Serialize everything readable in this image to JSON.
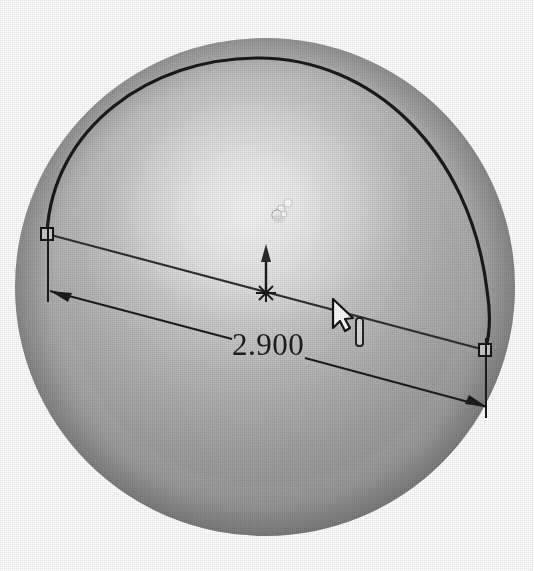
{
  "viewport": {
    "background_color": "#ffffff",
    "width": 534,
    "height": 571,
    "label": "3D model graphics area"
  },
  "model": {
    "name": "sphere-body",
    "shape": "sphere",
    "shading": "shaded",
    "base_color": "#9a9a9a",
    "highlight_color": "#e2e2e2",
    "shadow_color": "#6e6e6e",
    "center_x": 265,
    "center_y": 287,
    "radius_x": 250,
    "radius_y": 249
  },
  "sketch": {
    "arc": {
      "name": "semicircular-arc",
      "color": "#1a1a1a",
      "stroke_width": 3.2
    },
    "chord": {
      "name": "chord-line",
      "color": "#2b2b2b",
      "stroke_width": 2.2,
      "start_x": 47,
      "start_y": 234,
      "end_x": 485,
      "end_y": 350
    },
    "endpoints": [
      {
        "name": "endpoint-handle-left",
        "x": 47,
        "y": 234
      },
      {
        "name": "endpoint-handle-right",
        "x": 485,
        "y": 350
      }
    ],
    "origin": {
      "name": "sketch-origin-marker",
      "x": 266,
      "y": 293,
      "glyph": "asterisk-point"
    },
    "axis_arrow": {
      "name": "revolve-axis-arrow",
      "direction": "up",
      "x": 266,
      "tail_y": 293,
      "head_y": 250
    }
  },
  "dimension": {
    "name": "linear-dimension",
    "value": "2.900",
    "units": "in",
    "color": "#1c1c1c",
    "text_x": 268,
    "text_y": 355,
    "arrow_left": {
      "x": 50,
      "y": 291
    },
    "arrow_right": {
      "x": 487,
      "y": 407
    },
    "extension_left": {
      "x": 48,
      "y_top": 234,
      "y_bottom": 300
    },
    "extension_right": {
      "x": 486,
      "y_top": 350,
      "y_bottom": 416
    }
  },
  "cursor": {
    "name": "mouse-pointer",
    "type": "arrow",
    "x": 337,
    "y": 308,
    "color": "#1f1f1f"
  },
  "text_indicator": {
    "name": "text-edit-ibeam",
    "type": "i-beam",
    "x": 360,
    "y": 330,
    "color": "#262626"
  },
  "selection_glyph": {
    "name": "selection-highlight-glyph",
    "x": 283,
    "y": 210,
    "color": "#fbfbfb"
  }
}
